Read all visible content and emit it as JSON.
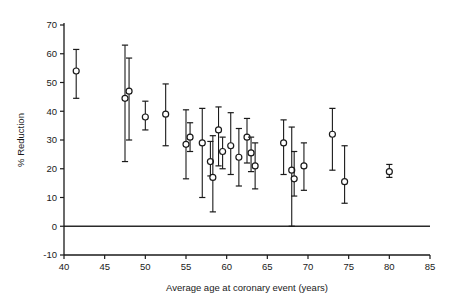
{
  "figure": {
    "name": "coronary-risk-reduction-scatter",
    "background": "#ffffff",
    "ink_color": "#1a1a1a"
  },
  "chart_data": {
    "type": "scatter",
    "title": "",
    "subtitle": "",
    "xlabel": "Average age at coronary event (years)",
    "ylabel": "% Reduction",
    "xlim": [
      40,
      85
    ],
    "ylim": [
      -10,
      70
    ],
    "xticks": [
      40,
      45,
      50,
      55,
      60,
      65,
      70,
      75,
      80,
      85
    ],
    "yticks": [
      -10,
      0,
      10,
      20,
      30,
      40,
      50,
      60,
      70
    ],
    "xtick_labels": [
      "40",
      "45",
      "50",
      "55",
      "60",
      "65",
      "70",
      "75",
      "80",
      "85"
    ],
    "ytick_labels": [
      "-10",
      "0",
      "10",
      "20",
      "30",
      "40",
      "50",
      "60",
      "70"
    ],
    "grid": false,
    "legend": false,
    "legend_position": "none",
    "reference_lines": [
      {
        "name": "zero-reduction-line",
        "orientation": "horizontal",
        "y": 0
      }
    ],
    "marker_style": "open-circle",
    "error_bars": "vertical-with-caps",
    "series": [
      {
        "name": "Trials",
        "points": [
          {
            "x": 41.5,
            "y": 54.0,
            "ylow": 44.5,
            "yhigh": 61.5
          },
          {
            "x": 47.5,
            "y": 44.5,
            "ylow": 22.5,
            "yhigh": 63.0
          },
          {
            "x": 48.0,
            "y": 47.0,
            "ylow": 30.0,
            "yhigh": 58.5
          },
          {
            "x": 50.0,
            "y": 38.0,
            "ylow": 33.5,
            "yhigh": 43.5
          },
          {
            "x": 52.5,
            "y": 39.0,
            "ylow": 28.0,
            "yhigh": 49.5
          },
          {
            "x": 55.0,
            "y": 28.5,
            "ylow": 16.5,
            "yhigh": 40.5
          },
          {
            "x": 55.5,
            "y": 31.0,
            "ylow": 26.0,
            "yhigh": 36.0
          },
          {
            "x": 57.0,
            "y": 29.0,
            "ylow": 10.0,
            "yhigh": 41.0
          },
          {
            "x": 58.0,
            "y": 22.5,
            "ylow": 17.5,
            "yhigh": 29.5
          },
          {
            "x": 58.3,
            "y": 17.0,
            "ylow": 5.0,
            "yhigh": 31.5
          },
          {
            "x": 59.0,
            "y": 33.5,
            "ylow": 21.0,
            "yhigh": 41.5
          },
          {
            "x": 59.5,
            "y": 26.0,
            "ylow": 20.0,
            "yhigh": 31.0
          },
          {
            "x": 60.5,
            "y": 28.0,
            "ylow": 18.0,
            "yhigh": 39.5
          },
          {
            "x": 61.5,
            "y": 24.0,
            "ylow": 14.0,
            "yhigh": 34.0
          },
          {
            "x": 62.5,
            "y": 31.0,
            "ylow": 22.0,
            "yhigh": 37.5
          },
          {
            "x": 63.0,
            "y": 25.5,
            "ylow": 19.0,
            "yhigh": 31.0
          },
          {
            "x": 63.5,
            "y": 21.0,
            "ylow": 13.0,
            "yhigh": 29.0
          },
          {
            "x": 67.0,
            "y": 29.0,
            "ylow": 18.0,
            "yhigh": 37.0
          },
          {
            "x": 68.0,
            "y": 19.5,
            "ylow": 0.0,
            "yhigh": 34.5
          },
          {
            "x": 68.3,
            "y": 16.5,
            "ylow": 10.5,
            "yhigh": 26.0
          },
          {
            "x": 69.5,
            "y": 21.0,
            "ylow": 12.5,
            "yhigh": 29.0
          },
          {
            "x": 73.0,
            "y": 32.0,
            "ylow": 19.5,
            "yhigh": 41.0
          },
          {
            "x": 74.5,
            "y": 15.5,
            "ylow": 8.0,
            "yhigh": 28.0
          },
          {
            "x": 80.0,
            "y": 19.0,
            "ylow": 17.0,
            "yhigh": 21.5
          }
        ]
      }
    ]
  }
}
